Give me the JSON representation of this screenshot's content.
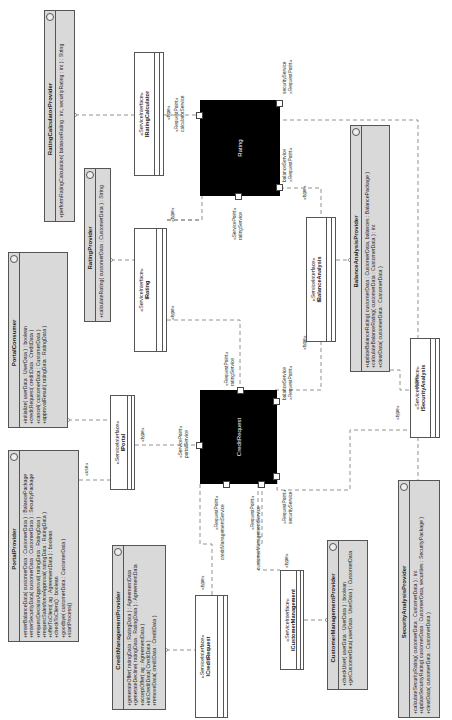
{
  "diagram": {
    "type": "UML component diagram (rotated 90°)",
    "components": [
      {
        "id": "rating",
        "name": "Rating"
      },
      {
        "id": "credit_request",
        "name": "CreditRequest"
      }
    ],
    "interfaces": {
      "stereotype": "«ServiceInterface»",
      "items": [
        {
          "id": "irating_calculator",
          "name": "IRatingCalculator"
        },
        {
          "id": "irating",
          "name": "IRating"
        },
        {
          "id": "iportal",
          "name": "IPortal"
        },
        {
          "id": "icredit_request",
          "name": "ICreditRequest"
        },
        {
          "id": "ibalance_analysis",
          "name": "IBalanceAnalysis"
        },
        {
          "id": "isecurity_analysis",
          "name": "ISecurityAnalysis"
        },
        {
          "id": "icustomer_management",
          "name": "ICustomerManagement"
        }
      ]
    },
    "classes": {
      "rating_calculator_provider": {
        "name": "RatingCalculatorProvider",
        "ops": [
          "+performRatingCalculation( balanceRating : int, securityRating : int ) : String"
        ]
      },
      "rating_provider": {
        "name": "RatingProvider",
        "ops": [
          "+calculateRating( customerData : CustomerData ) : String"
        ]
      },
      "portal_consumer": {
        "name": "PortalConsumer",
        "ops": [
          "+initialize( userData : UserData ) : boolean",
          "+creditRequest( creditData : CreditData )",
          "+cancel( customerData : CustomerData )",
          "+approvalResult( ratingData : RatingData )"
        ]
      },
      "portal_provider": {
        "name": "PortalProvider",
        "ops": [
          "+enterBalanceData( customerData : CustomerData ) : BalancePackage",
          "+enterSecurityData( customerData : CustomerData ) : SecurityPackage",
          "+requestDecisionApproval( ratingData : RatingData )",
          "+requestSalesforceApproval( ratingData : RatingData )",
          "+offerToClient( ag : AgreementData ) : boolean",
          "+checkToClient() : boolean",
          "+goodbye( customerData : CustomerData )",
          "+startProcess()"
        ]
      },
      "credit_management_provider": {
        "name": "CreditManagementProvider",
        "ops": [
          "+generateOffer( ratingData : RatingData ) : AgreementData",
          "+generateDecline( ratingData : RatingData ) : AgreementData",
          "+acceptOffer( ag : AgreementData )",
          "+initCreditData( CreditData )",
          "+removeData( creditData : CreditData )"
        ]
      },
      "balance_analysis_provider": {
        "name": "BalanceAnalysisProvider",
        "ops": [
          "+updateBalanceRating( customerData : CustomerData, balances : BalancePackage )",
          "+calculateBalanceRating( customerData : CustomerData ) : int",
          "+clearData( customerData : CustomerData )"
        ]
      },
      "customer_management_provider": {
        "name": "CustomerManagementProvider",
        "ops": [
          "+checkUser( userData : UserData ) : boolean",
          "+getCustomerData( userData : UserData ) : CustomerData"
        ]
      },
      "security_analysis_provider": {
        "name": "SecurityAnalysisProvider",
        "ops": [
          "+calculateSecurityRating( customerData : CustomerData ) : int",
          "+updateSecurityRating( customerData : CustomerData, securities : SecurityPackage )",
          "+clearData( customerData : CustomerData )"
        ]
      }
    },
    "labels": {
      "type": "«type»",
      "use": "«use»",
      "request_point": "«RequestPoint»",
      "service_point": "«ServicePoint»",
      "calculator_service": "calculatorService",
      "security_service": "securityService",
      "balance_service": "balanceService",
      "rating_service": "ratingService",
      "portal_service": "portalService",
      "credit_management_service": "creditManagementService",
      "customer_management_service": "customerManagementService"
    }
  }
}
